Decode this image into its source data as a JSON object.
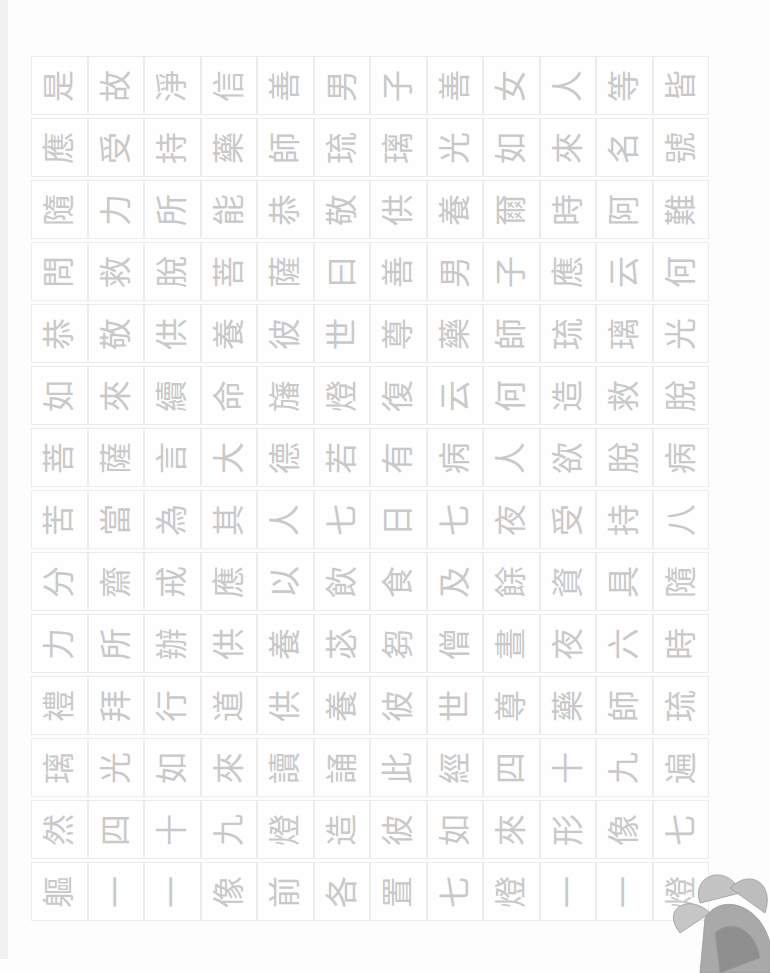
{
  "page": {
    "rows": [
      [
        "是",
        "故",
        "淨",
        "信",
        "善",
        "男",
        "子",
        "善",
        "女",
        "人",
        "等",
        "皆"
      ],
      [
        "應",
        "受",
        "持",
        "藥",
        "師",
        "琉",
        "璃",
        "光",
        "如",
        "來",
        "名",
        "號"
      ],
      [
        "隨",
        "力",
        "所",
        "能",
        "恭",
        "敬",
        "供",
        "養",
        "爾",
        "時",
        "阿",
        "難"
      ],
      [
        "問",
        "救",
        "脫",
        "菩",
        "薩",
        "曰",
        "善",
        "男",
        "子",
        "應",
        "云",
        "何"
      ],
      [
        "恭",
        "敬",
        "供",
        "養",
        "彼",
        "世",
        "尊",
        "藥",
        "師",
        "琉",
        "璃",
        "光"
      ],
      [
        "如",
        "來",
        "續",
        "命",
        "旛",
        "燈",
        "復",
        "云",
        "何",
        "造",
        "救",
        "脫"
      ],
      [
        "菩",
        "薩",
        "言",
        "大",
        "德",
        "若",
        "有",
        "病",
        "人",
        "欲",
        "脫",
        "病"
      ],
      [
        "苦",
        "當",
        "為",
        "其",
        "人",
        "七",
        "日",
        "七",
        "夜",
        "受",
        "持",
        "八"
      ],
      [
        "分",
        "齋",
        "戒",
        "應",
        "以",
        "飲",
        "食",
        "及",
        "餘",
        "資",
        "具",
        "隨"
      ],
      [
        "力",
        "所",
        "辦",
        "供",
        "養",
        "苾",
        "芻",
        "僧",
        "晝",
        "夜",
        "六",
        "時"
      ],
      [
        "禮",
        "拜",
        "行",
        "道",
        "供",
        "養",
        "彼",
        "世",
        "尊",
        "藥",
        "師",
        "琉"
      ],
      [
        "璃",
        "光",
        "如",
        "來",
        "讀",
        "誦",
        "此",
        "經",
        "四",
        "十",
        "九",
        "遍"
      ],
      [
        "然",
        "四",
        "十",
        "九",
        "燈",
        "造",
        "彼",
        "如",
        "來",
        "形",
        "像",
        "七"
      ],
      [
        "軀",
        "一",
        "一",
        "像",
        "前",
        "各",
        "置",
        "七",
        "燈",
        "一",
        "一",
        "燈"
      ]
    ],
    "decoration": "peony-flower"
  }
}
